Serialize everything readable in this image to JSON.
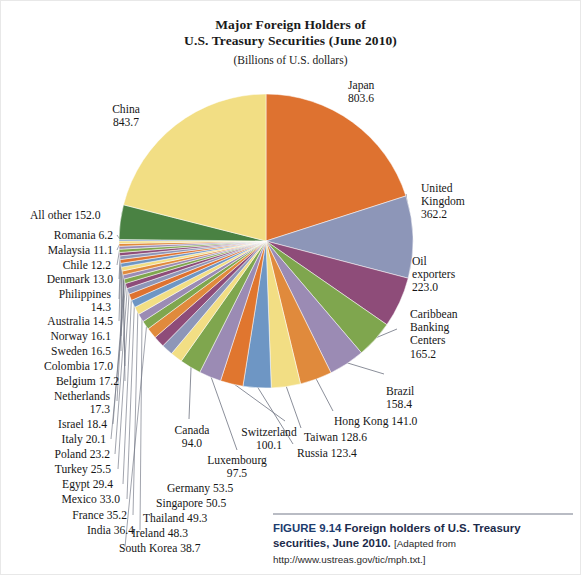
{
  "title": {
    "line1": "Major Foreign Holders of",
    "line2": "U.S. Treasury Securities (June 2010)",
    "line3": "(Billions of U.S. dollars)"
  },
  "caption": {
    "figure_number": "FIGURE 9.14",
    "text": "Foreign holders of U.S. Treasury securities, June 2010.",
    "source": "[Adapted from http://www.ustreas.gov/tic/mph.txt.]"
  },
  "labels": {
    "japan": "Japan\n803.6",
    "china": "China\n843.7",
    "uk": "United\nKingdom\n362.2",
    "oil": "Oil\nexporters\n223.0",
    "caribbean": "Caribbean\nBanking\nCenters\n165.2",
    "brazil": "Brazil\n158.4",
    "hongkong": "Hong Kong 141.0",
    "taiwan": "Taiwan 128.6",
    "russia": "Russia 123.4",
    "switzerland": "Switzerland\n100.1",
    "luxembourg": "Luxembourg\n97.5",
    "canada": "Canada\n94.0",
    "germany": "Germany 53.5",
    "singapore": "Singapore 50.5",
    "thailand": "Thailand 49.3",
    "ireland": "Ireland 48.3",
    "southkorea": "South Korea 38.7",
    "india": "India 36.4",
    "france": "France 35.2",
    "mexico": "Mexico 33.0",
    "egypt": "Egypt 29.4",
    "turkey": "Turkey 25.5",
    "poland": "Poland 23.2",
    "italy": "Italy 20.1",
    "israel": "Israel 18.4",
    "netherlands": "Netherlands\n17.3",
    "belgium": "Belgium 17.2",
    "colombia": "Colombia 17.0",
    "sweden": "Sweden 16.5",
    "norway": "Norway 16.1",
    "australia": "Australia 14.5",
    "philippines": "Philippines\n14.3",
    "denmark": "Denmark 13.0",
    "chile": "Chile 12.2",
    "malaysia": "Malaysia 11.1",
    "romania": "Romania 6.2",
    "allother": "All other 152.0"
  },
  "chart_data": {
    "type": "pie",
    "title": "Major Foreign Holders of U.S. Treasury Securities (June 2010)",
    "subtitle": "(Billions of U.S. dollars)",
    "unit": "Billions of U.S. dollars",
    "legend": "labeled-slices",
    "grid": false,
    "start_angle_deg": 0,
    "direction": "clockwise",
    "categories": [
      "Japan",
      "United Kingdom",
      "Oil exporters",
      "Caribbean Banking Centers",
      "Brazil",
      "Hong Kong",
      "Taiwan",
      "Russia",
      "Switzerland",
      "Luxembourg",
      "Canada",
      "Germany",
      "Singapore",
      "Thailand",
      "Ireland",
      "South Korea",
      "India",
      "France",
      "Mexico",
      "Egypt",
      "Turkey",
      "Poland",
      "Italy",
      "Israel",
      "Netherlands",
      "Belgium",
      "Colombia",
      "Sweden",
      "Norway",
      "Australia",
      "Philippines",
      "Denmark",
      "Chile",
      "Malaysia",
      "Romania",
      "All other",
      "China"
    ],
    "values": [
      803.6,
      362.2,
      223.0,
      165.2,
      158.4,
      141.0,
      128.6,
      123.4,
      100.1,
      97.5,
      94.0,
      53.5,
      50.5,
      49.3,
      48.3,
      38.7,
      36.4,
      35.2,
      33.0,
      29.4,
      25.5,
      23.2,
      20.1,
      18.4,
      17.3,
      17.2,
      17.0,
      16.5,
      16.1,
      14.5,
      14.3,
      13.0,
      12.2,
      11.1,
      6.2,
      152.0,
      843.7
    ],
    "colors": [
      "#DE7230",
      "#8D96B8",
      "#8E4C79",
      "#7FA64E",
      "#9B8BB4",
      "#E08A3C",
      "#F2DE84",
      "#6E96C4",
      "#E0762F",
      "#9B8BB4",
      "#7FA64E",
      "#F2DE84",
      "#8D96B8",
      "#8E4C79",
      "#E08A3C",
      "#7FA64E",
      "#9B8BB4",
      "#F2DE84",
      "#6E96C4",
      "#DE7230",
      "#8D96B8",
      "#8E4C79",
      "#7FA64E",
      "#9B8BB4",
      "#E08A3C",
      "#F2DE84",
      "#6E96C4",
      "#DE7230",
      "#8D96B8",
      "#8E4C79",
      "#7FA64E",
      "#9B8BB4",
      "#E08A3C",
      "#F2DE84",
      "#6E96C4",
      "#4A8243",
      "#F2DE84"
    ],
    "total": 3894.8
  },
  "palette": {
    "japan_orange": "#DE7230",
    "china_yellow": "#F2DE84",
    "uk_slate": "#8D96B8",
    "oil_purple": "#8E4C79",
    "green": "#7FA64E",
    "allother_green": "#4A8243",
    "lavender": "#9B8BB4",
    "blue": "#6E96C4",
    "leader_line": "#6d7280"
  }
}
